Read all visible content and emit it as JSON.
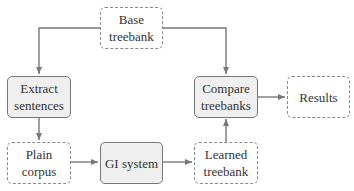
{
  "diagram": {
    "nodes": {
      "base_treebank": {
        "line1": "Base",
        "line2": "treebank",
        "style": "dashed"
      },
      "extract_sentences": {
        "line1": "Extract",
        "line2": "sentences",
        "style": "solid"
      },
      "compare_treebanks": {
        "line1": "Compare",
        "line2": "treebanks",
        "style": "solid"
      },
      "results": {
        "line1": "Results",
        "style": "dashed"
      },
      "plain_corpus": {
        "line1": "Plain",
        "line2": "corpus",
        "style": "dashed"
      },
      "gi_system": {
        "line1": "GI system",
        "style": "solid"
      },
      "learned_treebank": {
        "line1": "Learned",
        "line2": "treebank",
        "style": "dashed"
      }
    },
    "edges": [
      {
        "from": "Base treebank",
        "to": "Extract sentences"
      },
      {
        "from": "Base treebank",
        "to": "Compare treebanks"
      },
      {
        "from": "Extract sentences",
        "to": "Plain corpus"
      },
      {
        "from": "Plain corpus",
        "to": "GI system"
      },
      {
        "from": "GI system",
        "to": "Learned treebank"
      },
      {
        "from": "Learned treebank",
        "to": "Compare treebanks"
      },
      {
        "from": "Compare treebanks",
        "to": "Results"
      }
    ],
    "colors": {
      "edge": "#777777",
      "solid_fill": "#efefef",
      "border": "#777777"
    }
  }
}
